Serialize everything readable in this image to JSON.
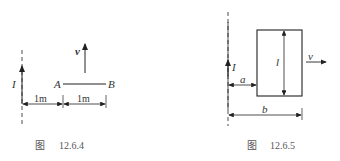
{
  "figures": [
    {
      "id": "fig-12-6-4",
      "caption_prefix": "图",
      "caption_number": "12.6.4",
      "current_label": "I",
      "rod_end_a": "A",
      "rod_end_b": "B",
      "velocity_label": "v",
      "dimensions": [
        {
          "label": "1m"
        },
        {
          "label": "1m"
        }
      ]
    },
    {
      "id": "fig-12-6-5",
      "caption_prefix": "图",
      "caption_number": "12.6.5",
      "current_label": "I",
      "loop_height_label": "l",
      "velocity_label": "v",
      "dimensions": [
        {
          "label": "a"
        },
        {
          "label": "b"
        }
      ]
    }
  ],
  "colors": {
    "line": "#222222",
    "text": "#333333",
    "caption": "#555555"
  }
}
